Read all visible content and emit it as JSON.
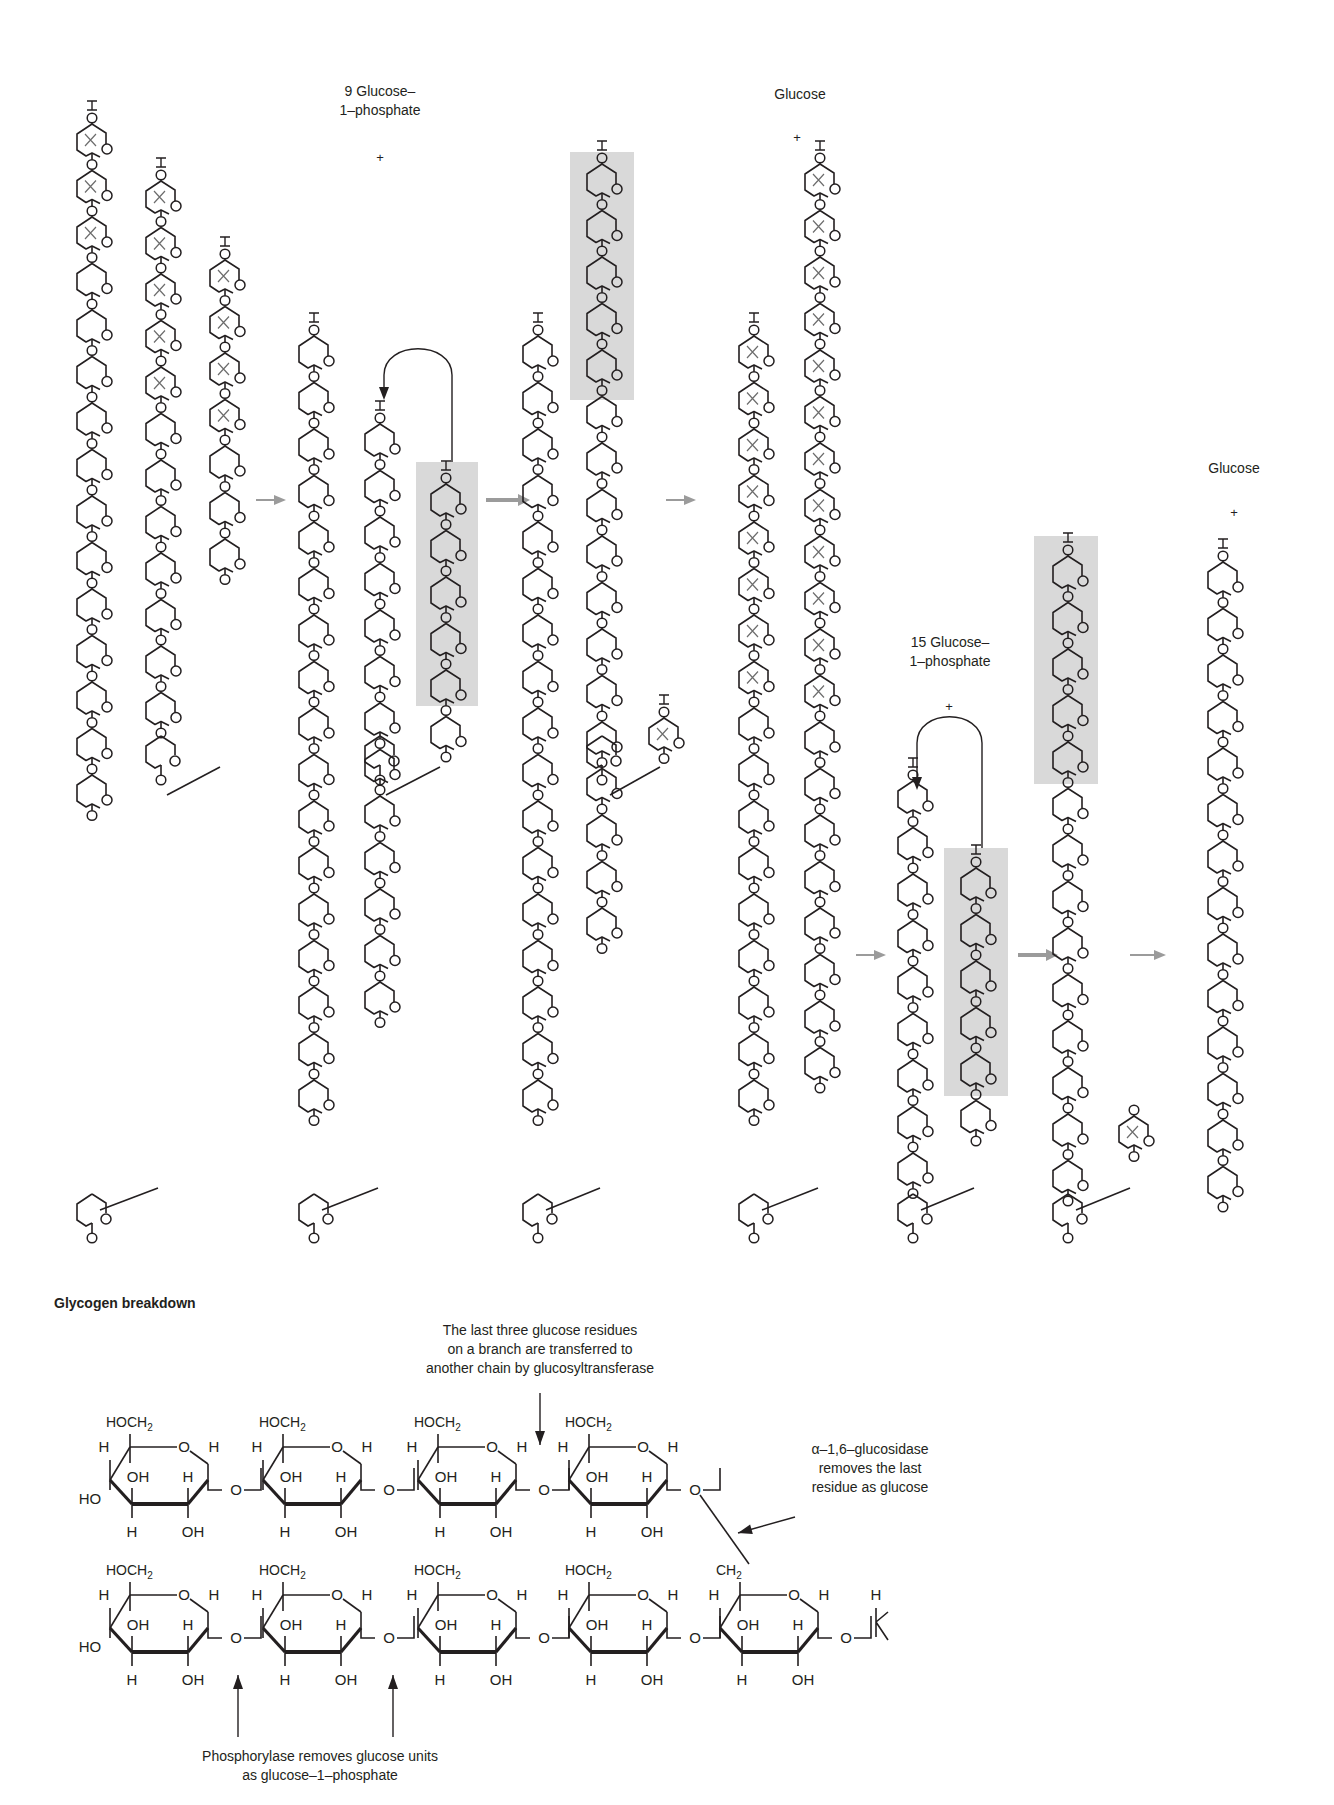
{
  "diagram": {
    "title": "Glycogen breakdown",
    "colors": {
      "ink": "#231f20",
      "highlight_box": "#d9d9d9",
      "process_arrow": "#9b9b9b",
      "cross_mark": "#6d6d6d"
    },
    "top_panel": {
      "step_labels": [
        {
          "id": "g1p-9",
          "line1": "9 Glucose–",
          "line2": "1–phosphate",
          "plus": "+"
        },
        {
          "id": "glucose-1",
          "line1": "Glucose",
          "plus": "+"
        },
        {
          "id": "g1p-15",
          "line1": "15 Glucose–",
          "line2": "1–phosphate",
          "plus": "+"
        },
        {
          "id": "glucose-2",
          "line1": "Glucose",
          "plus": "+"
        }
      ],
      "ring_label_O": "O",
      "ring_label_OH": "OH",
      "stages": [
        {
          "name": "initial-branched-glycogen",
          "chains": [
            {
              "units": 15,
              "crossed": 3
            },
            {
              "units": 12,
              "crossed": 5
            },
            {
              "units": 7,
              "crossed": 4
            }
          ]
        },
        {
          "name": "after-phosphorylase-1",
          "chains": [
            {
              "units": 15
            },
            {
              "units": 12
            },
            {
              "units": 4,
              "highlighted": 3
            }
          ]
        },
        {
          "name": "after-transferase-1",
          "chains": [
            {
              "units": 15,
              "highlighted_top": 3
            },
            {
              "units": 11
            },
            {
              "units": 1,
              "crossed": 1
            }
          ]
        },
        {
          "name": "after-glucosidase-1",
          "chains": [
            {
              "units": 13,
              "crossed": 8
            },
            {
              "units": 15,
              "crossed": 12
            }
          ]
        },
        {
          "name": "after-phosphorylase-2",
          "chains": [
            {
              "units": 8
            },
            {
              "units": 4,
              "highlighted": 3
            }
          ]
        },
        {
          "name": "after-transferase-2",
          "chains": [
            {
              "units": 11,
              "highlighted_top": 3
            },
            {
              "units": 1,
              "crossed": 1
            }
          ]
        },
        {
          "name": "final-linear-chain",
          "chains": [
            {
              "units": 11
            }
          ]
        }
      ]
    },
    "bottom_panel": {
      "annotations": {
        "transferase": [
          "The last three glucose residues",
          "on a branch are transferred to",
          "another chain by glucosyltransferase"
        ],
        "glucosidase": [
          "α–1,6–glucosidase",
          "removes the last",
          "residue as glucose"
        ],
        "phosphorylase": [
          "Phosphorylase removes glucose units",
          "as glucose–1–phosphate"
        ]
      },
      "atom_labels": {
        "hoch2": "HOCH",
        "ch2": "CH",
        "sub2": "2",
        "h": "H",
        "oh": "OH",
        "ho": "HO",
        "o": "O"
      },
      "upper_chain_residues": 4,
      "lower_chain_residues": 5
    }
  }
}
